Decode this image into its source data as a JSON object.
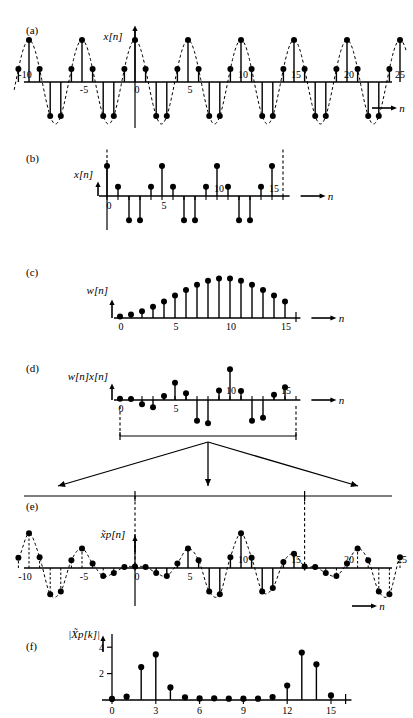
{
  "figure": {
    "title_axis_label": "n",
    "panels": [
      {
        "id": "a",
        "label": "(a)",
        "ylabel": "x[n]"
      },
      {
        "id": "b",
        "label": "(b)",
        "ylabel": "x[n]"
      },
      {
        "id": "c",
        "label": "(c)",
        "ylabel": "w[n]"
      },
      {
        "id": "d",
        "label": "(d)",
        "ylabel": "w[n]x[n]"
      },
      {
        "id": "e",
        "label": "(e)",
        "ylabel": "x̃p[n]"
      },
      {
        "id": "f",
        "label": "(f)",
        "ylabel": "|X̃p[k]|"
      }
    ]
  },
  "chart_data": [
    {
      "type": "line",
      "panel": "a",
      "title": "",
      "ylabel": "x[n]",
      "xlabel": "n",
      "xlim": [
        -11,
        26
      ],
      "ylim": [
        -1.15,
        1.15
      ],
      "xticks": [
        -10,
        -5,
        0,
        5,
        10,
        15,
        20,
        25
      ],
      "xticklabels": [
        "-10",
        "-5",
        "0",
        "5",
        "10",
        "15",
        "20",
        "25"
      ],
      "grid": false,
      "legend": "none",
      "description": "cosine sampled, period 5 samples, dashed envelope",
      "x": [
        -11,
        -10,
        -9,
        -8,
        -7,
        -6,
        -5,
        -4,
        -3,
        -2,
        -1,
        0,
        1,
        2,
        3,
        4,
        5,
        6,
        7,
        8,
        9,
        10,
        11,
        12,
        13,
        14,
        15,
        16,
        17,
        18,
        19,
        20,
        21,
        22,
        23,
        24,
        25
      ],
      "values": [
        0.31,
        1.0,
        0.31,
        -0.81,
        -0.81,
        0.31,
        1.0,
        0.31,
        -0.81,
        -0.81,
        0.31,
        1.0,
        0.31,
        -0.81,
        -0.81,
        0.31,
        1.0,
        0.31,
        -0.81,
        -0.81,
        0.31,
        1.0,
        0.31,
        -0.81,
        -0.81,
        0.31,
        1.0,
        0.31,
        -0.81,
        -0.81,
        0.31,
        1.0,
        0.31,
        -0.81,
        -0.81,
        0.31,
        1.0
      ]
    },
    {
      "type": "line",
      "panel": "b",
      "ylabel": "x[n]",
      "xlabel": "n",
      "xlim": [
        -0.6,
        16.5
      ],
      "ylim": [
        -1.15,
        1.15
      ],
      "xticks": [
        0,
        5,
        10,
        15
      ],
      "xticklabels": [
        "0",
        "5",
        "10",
        "15"
      ],
      "grid": false,
      "legend": "none",
      "description": "finite extracted segment of x[n] for 0<=n<=15",
      "x": [
        0,
        1,
        2,
        3,
        4,
        5,
        6,
        7,
        8,
        9,
        10,
        11,
        12,
        13,
        14,
        15
      ],
      "values": [
        1.0,
        0.31,
        -0.81,
        -0.81,
        0.31,
        1.0,
        0.31,
        -0.81,
        -0.81,
        0.31,
        1.0,
        0.31,
        -0.81,
        -0.81,
        0.31,
        1.0
      ]
    },
    {
      "type": "line",
      "panel": "c",
      "ylabel": "w[n]",
      "xlabel": "n",
      "xlim": [
        -0.6,
        16.5
      ],
      "ylim": [
        0,
        1.08
      ],
      "xticks": [
        0,
        5,
        10,
        15
      ],
      "xticklabels": [
        "0",
        "5",
        "10",
        "15"
      ],
      "grid": false,
      "legend": "none",
      "description": "Hamming-type tapered window, peak near n=7-8",
      "x": [
        0,
        1,
        2,
        3,
        4,
        5,
        6,
        7,
        8,
        9,
        10,
        11,
        12,
        13,
        14,
        15
      ],
      "values": [
        0.04,
        0.09,
        0.17,
        0.28,
        0.41,
        0.56,
        0.7,
        0.83,
        0.93,
        0.99,
        0.99,
        0.93,
        0.83,
        0.7,
        0.56,
        0.41
      ]
    },
    {
      "type": "line",
      "panel": "d",
      "ylabel": "w[n]x[n]",
      "xlabel": "n",
      "xlim": [
        -0.6,
        16.5
      ],
      "ylim": [
        -1.05,
        1.05
      ],
      "xticks": [
        0,
        5,
        10,
        15
      ],
      "xticklabels": [
        "0",
        "5",
        "10",
        "15"
      ],
      "grid": false,
      "legend": "none",
      "description": "product of window and signal",
      "x": [
        0,
        1,
        2,
        3,
        4,
        5,
        6,
        7,
        8,
        9,
        10,
        11,
        12,
        13,
        14,
        15
      ],
      "values": [
        0.04,
        0.03,
        -0.14,
        -0.23,
        0.13,
        0.56,
        0.22,
        -0.67,
        -0.75,
        0.31,
        0.99,
        0.29,
        -0.67,
        -0.57,
        0.17,
        0.41
      ]
    },
    {
      "type": "line",
      "panel": "e",
      "ylabel": "x̃p[n]",
      "xlabel": "n",
      "xlim": [
        -11,
        26
      ],
      "ylim": [
        -1.05,
        1.05
      ],
      "xticks": [
        -10,
        -5,
        0,
        5,
        10,
        15,
        20,
        25
      ],
      "xticklabels": [
        "-10",
        "-5",
        "0",
        "5",
        "10",
        "15",
        "20",
        "25"
      ],
      "grid": false,
      "legend": "none",
      "description": "periodic extension, period 16, of the windowed sequence",
      "period": 16,
      "x": [
        -11,
        -10,
        -9,
        -8,
        -7,
        -6,
        -5,
        -4,
        -3,
        -2,
        -1,
        0,
        1,
        2,
        3,
        4,
        5,
        6,
        7,
        8,
        9,
        10,
        11,
        12,
        13,
        14,
        15,
        16,
        17,
        18,
        19,
        20,
        21,
        22,
        23,
        24,
        25
      ],
      "values": [
        0.29,
        0.99,
        0.31,
        -0.75,
        -0.67,
        0.22,
        0.56,
        0.13,
        -0.23,
        -0.14,
        0.03,
        0.04,
        0.03,
        -0.14,
        -0.23,
        0.13,
        0.56,
        0.22,
        -0.67,
        -0.75,
        0.31,
        0.99,
        0.29,
        -0.67,
        -0.57,
        0.17,
        0.41,
        0.04,
        0.03,
        -0.14,
        -0.23,
        0.13,
        0.56,
        0.22,
        -0.67,
        -0.75,
        0.31
      ]
    },
    {
      "type": "bar",
      "panel": "f",
      "ylabel": "|X̃p[k]|",
      "xlabel": "",
      "xlim": [
        -0.6,
        16.5
      ],
      "ylim": [
        0,
        5.0
      ],
      "xticks": [
        0,
        3,
        6,
        9,
        12,
        15
      ],
      "xticklabels": [
        "0",
        "3",
        "6",
        "9",
        "12",
        "15"
      ],
      "yticks": [
        2,
        4
      ],
      "yticklabels": [
        "2",
        "4"
      ],
      "grid": false,
      "legend": "none",
      "description": "DFT magnitude of the periodic windowed sequence, 16 points",
      "categories": [
        0,
        1,
        2,
        3,
        4,
        5,
        6,
        7,
        8,
        9,
        10,
        11,
        12,
        13,
        14,
        15
      ],
      "values": [
        0.08,
        0.25,
        2.5,
        3.45,
        0.95,
        0.2,
        0.12,
        0.13,
        0.1,
        0.1,
        0.1,
        0.22,
        1.1,
        3.6,
        2.7,
        0.35
      ]
    }
  ]
}
